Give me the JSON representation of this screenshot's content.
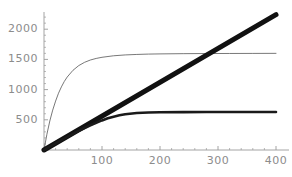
{
  "chart_data": {
    "type": "line",
    "title": "",
    "subtitle": "",
    "xlabel": "",
    "ylabel": "",
    "xlim": [
      0,
      410
    ],
    "ylim": [
      0,
      2280
    ],
    "grid": false,
    "legend": null,
    "legend_position": "none",
    "x_ticks": [
      100,
      200,
      300,
      400
    ],
    "x_tick_labels": [
      "100",
      "200",
      "300",
      "400"
    ],
    "y_ticks": [
      500,
      1000,
      1500,
      2000
    ],
    "y_tick_labels": [
      "500",
      "1000",
      "1500",
      "2000"
    ],
    "axis_color": "#9a9a9a",
    "series": [
      {
        "name": "thin-saturating-curve",
        "style": "thin",
        "color": "#555555",
        "width": 0.8,
        "plateau": 1600,
        "x": [
          0,
          5,
          10,
          15,
          20,
          25,
          30,
          35,
          40,
          50,
          60,
          70,
          80,
          90,
          100,
          120,
          140,
          160,
          180,
          200,
          240,
          280,
          320,
          360,
          400
        ],
        "y": [
          0,
          260,
          480,
          660,
          810,
          940,
          1045,
          1135,
          1208,
          1320,
          1398,
          1452,
          1490,
          1516,
          1535,
          1560,
          1574,
          1582,
          1588,
          1591,
          1595,
          1597,
          1598,
          1599,
          1600
        ]
      },
      {
        "name": "thick-straight-line",
        "style": "very-thick",
        "color": "#111111",
        "width": 5.0,
        "slope": 5.6,
        "x": [
          0,
          400
        ],
        "y": [
          0,
          2240
        ]
      },
      {
        "name": "medium-saturating-curve",
        "style": "thick",
        "color": "#1a1a1a",
        "width": 2.6,
        "plateau": 630,
        "x": [
          0,
          10,
          20,
          30,
          40,
          50,
          60,
          70,
          80,
          90,
          100,
          110,
          120,
          130,
          140,
          160,
          180,
          200,
          240,
          280,
          320,
          360,
          400
        ],
        "y": [
          0,
          54,
          108,
          162,
          214,
          266,
          316,
          364,
          410,
          452,
          490,
          524,
          552,
          575,
          592,
          612,
          620,
          624,
          627,
          628,
          629,
          630,
          630
        ]
      }
    ],
    "crossings": [
      {
        "series_a": "thick-straight-line",
        "series_b": "medium-saturating-curve",
        "x": 113,
        "y": 632
      },
      {
        "series_a": "thick-straight-line",
        "series_b": "thin-saturating-curve",
        "x": 285,
        "y": 1596
      }
    ]
  }
}
